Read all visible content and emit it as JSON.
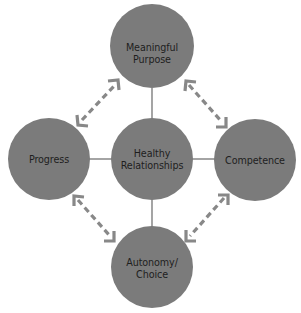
{
  "diagram": {
    "colors": {
      "node_fill": "#7b7b7b",
      "connector": "#5a5a5a",
      "arrow": "#888888",
      "text": "#1e1e1e",
      "background": "#ffffff"
    },
    "center": {
      "id": "healthy-relationships",
      "lines": [
        "Healthy",
        "Relationships"
      ]
    },
    "nodes": {
      "top": {
        "id": "meaningful-purpose",
        "lines": [
          "Meaningful",
          "Purpose"
        ]
      },
      "left": {
        "id": "progress",
        "lines": [
          "Progress"
        ]
      },
      "right": {
        "id": "competence",
        "lines": [
          "Competence"
        ]
      },
      "bottom": {
        "id": "autonomy-choice",
        "lines": [
          "Autonomy/",
          "Choice"
        ]
      }
    },
    "connections": [
      {
        "from": "healthy-relationships",
        "to": "meaningful-purpose",
        "style": "solid-line"
      },
      {
        "from": "healthy-relationships",
        "to": "progress",
        "style": "solid-line"
      },
      {
        "from": "healthy-relationships",
        "to": "competence",
        "style": "solid-line"
      },
      {
        "from": "healthy-relationships",
        "to": "autonomy-choice",
        "style": "solid-line"
      },
      {
        "from": "progress",
        "to": "meaningful-purpose",
        "style": "dashed-double-arrow"
      },
      {
        "from": "meaningful-purpose",
        "to": "competence",
        "style": "dashed-double-arrow"
      },
      {
        "from": "progress",
        "to": "autonomy-choice",
        "style": "dashed-double-arrow"
      },
      {
        "from": "competence",
        "to": "autonomy-choice",
        "style": "dashed-double-arrow"
      }
    ]
  }
}
